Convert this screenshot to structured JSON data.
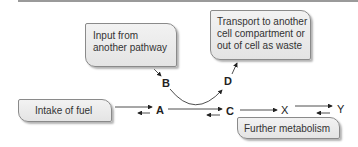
{
  "diagram": {
    "boxes": {
      "intake": "Intake of fuel",
      "input": [
        "Input from",
        "another pathway"
      ],
      "transport": [
        "Transport to another",
        "cell compartment or",
        "out of cell as waste"
      ],
      "further": "Further metabolism"
    },
    "nodes": {
      "a": "A",
      "b": "B",
      "c": "C",
      "d": "D",
      "x": "X",
      "y": "Y"
    }
  }
}
